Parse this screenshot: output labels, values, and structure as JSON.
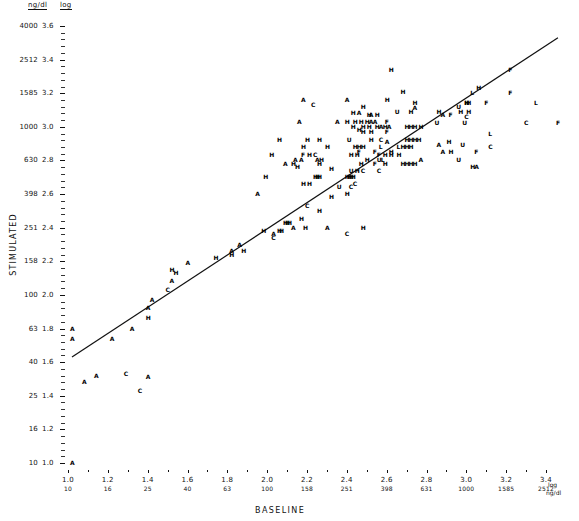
{
  "chart_data": {
    "type": "scatter",
    "title": "",
    "xlabel": "BASELINE",
    "ylabel": "STIMULATED",
    "axis_headers": {
      "units": "ng/dl",
      "scale": "log"
    },
    "x_unit_label": "log",
    "x_unit_label2": "ng/dl",
    "xlim_log": [
      1.0,
      3.5
    ],
    "ylim_log": [
      0.98,
      3.62
    ],
    "grid": false,
    "legend": null,
    "y_ticks_log": [
      "3.6",
      "3.4",
      "3.2",
      "3.0",
      "2.8",
      "2.6",
      "2.4",
      "2.2",
      "2.0",
      "1.8",
      "1.6",
      "1.4",
      "1.2",
      "1.0"
    ],
    "y_ticks_ngdl": [
      "4000",
      "2512",
      "1585",
      "1000",
      "630",
      "398",
      "251",
      "158",
      "100",
      "63",
      "40",
      "25",
      "16",
      "10"
    ],
    "x_ticks_log": [
      "1.0",
      "1.2",
      "1.4",
      "1.6",
      "1.8",
      "2.0",
      "2.2",
      "2.4",
      "2.6",
      "2.8",
      "3.0",
      "3.2",
      "3.4"
    ],
    "x_ticks_ngdl": [
      "10",
      "16",
      "25",
      "40",
      "63",
      "100",
      "158",
      "251",
      "398",
      "631",
      "1000",
      "1585",
      "2512"
    ],
    "regression_line": {
      "x0": 1.02,
      "y0": 1.63,
      "x1": 3.46,
      "y1": 3.53
    },
    "marker_groups": [
      "H",
      "A",
      "C",
      "U",
      "F",
      "L"
    ],
    "points": [
      [
        "H",
        2.62,
        3.34
      ],
      [
        "F",
        3.22,
        3.34
      ],
      [
        "H",
        3.06,
        3.23
      ],
      [
        "H",
        2.68,
        3.21
      ],
      [
        "L",
        3.03,
        3.2
      ],
      [
        "F",
        3.22,
        3.2
      ],
      [
        "H",
        2.6,
        3.16
      ],
      [
        "A",
        2.18,
        3.16
      ],
      [
        "A",
        2.4,
        3.16
      ],
      [
        "H",
        2.74,
        3.14
      ],
      [
        "H",
        3.0,
        3.14
      ],
      [
        "H",
        3.0,
        3.14
      ],
      [
        "H",
        3.01,
        3.14
      ],
      [
        "F",
        3.1,
        3.14
      ],
      [
        "L",
        3.35,
        3.14
      ],
      [
        "C",
        2.23,
        3.13
      ],
      [
        "H",
        2.48,
        3.12
      ],
      [
        "U",
        2.96,
        3.12
      ],
      [
        "A",
        2.74,
        3.11
      ],
      [
        "H",
        2.72,
        3.09
      ],
      [
        "U",
        2.65,
        3.09
      ],
      [
        "H",
        2.86,
        3.09
      ],
      [
        "H",
        2.97,
        3.09
      ],
      [
        "H",
        3.01,
        3.09
      ],
      [
        "A",
        2.46,
        3.08
      ],
      [
        "H",
        2.43,
        3.08
      ],
      [
        "A",
        2.52,
        3.07
      ],
      [
        "H",
        2.51,
        3.07
      ],
      [
        "H",
        2.55,
        3.07
      ],
      [
        "A",
        2.88,
        3.07
      ],
      [
        "F",
        2.92,
        3.07
      ],
      [
        "C",
        3.0,
        3.06
      ],
      [
        "A",
        2.16,
        3.03
      ],
      [
        "A",
        2.35,
        3.03
      ],
      [
        "H",
        2.4,
        3.03
      ],
      [
        "H",
        2.44,
        3.03
      ],
      [
        "H",
        2.47,
        3.03
      ],
      [
        "H",
        2.5,
        3.03
      ],
      [
        "A",
        2.52,
        3.03
      ],
      [
        "A",
        2.54,
        3.03
      ],
      [
        "F",
        2.6,
        3.03
      ],
      [
        "U",
        2.85,
        3.02
      ],
      [
        "U",
        2.99,
        3.02
      ],
      [
        "C",
        3.3,
        3.02
      ],
      [
        "F",
        3.46,
        3.02
      ],
      [
        "H",
        2.43,
        3.0
      ],
      [
        "H",
        2.48,
        3.0
      ],
      [
        "H",
        2.51,
        3.0
      ],
      [
        "H",
        2.55,
        3.0
      ],
      [
        "A",
        2.57,
        3.0
      ],
      [
        "H",
        2.59,
        3.0
      ],
      [
        "A",
        2.61,
        3.0
      ],
      [
        "H",
        2.7,
        3.0
      ],
      [
        "H",
        2.72,
        3.0
      ],
      [
        "H",
        2.74,
        3.0
      ],
      [
        "H",
        2.77,
        3.0
      ],
      [
        "H",
        2.46,
        2.98
      ],
      [
        "F",
        2.6,
        2.97
      ],
      [
        "H",
        2.48,
        2.97
      ],
      [
        "H",
        2.52,
        2.97
      ],
      [
        "L",
        3.12,
        2.96
      ],
      [
        "H",
        2.06,
        2.92
      ],
      [
        "H",
        2.2,
        2.92
      ],
      [
        "H",
        2.26,
        2.92
      ],
      [
        "U",
        2.41,
        2.92
      ],
      [
        "H",
        2.52,
        2.92
      ],
      [
        "C",
        2.57,
        2.92
      ],
      [
        "A",
        2.6,
        2.91
      ],
      [
        "H",
        2.7,
        2.92
      ],
      [
        "H",
        2.72,
        2.92
      ],
      [
        "H",
        2.74,
        2.92
      ],
      [
        "H",
        2.76,
        2.92
      ],
      [
        "H",
        2.91,
        2.91
      ],
      [
        "A",
        2.86,
        2.89
      ],
      [
        "U",
        2.98,
        2.89
      ],
      [
        "C",
        3.12,
        2.88
      ],
      [
        "H",
        2.18,
        2.88
      ],
      [
        "H",
        2.3,
        2.88
      ],
      [
        "H",
        2.44,
        2.88
      ],
      [
        "H",
        2.46,
        2.88
      ],
      [
        "H",
        2.48,
        2.88
      ],
      [
        "L",
        2.57,
        2.88
      ],
      [
        "L",
        2.66,
        2.88
      ],
      [
        "H",
        2.68,
        2.88
      ],
      [
        "H",
        2.7,
        2.88
      ],
      [
        "H",
        2.72,
        2.88
      ],
      [
        "F",
        2.46,
        2.85
      ],
      [
        "F",
        2.54,
        2.85
      ],
      [
        "H",
        2.62,
        2.85
      ],
      [
        "A",
        2.88,
        2.85
      ],
      [
        "H",
        2.92,
        2.85
      ],
      [
        "F",
        3.05,
        2.85
      ],
      [
        "H",
        2.02,
        2.83
      ],
      [
        "F",
        2.18,
        2.83
      ],
      [
        "H",
        2.21,
        2.83
      ],
      [
        "C",
        2.24,
        2.83
      ],
      [
        "H",
        2.42,
        2.83
      ],
      [
        "H",
        2.45,
        2.83
      ],
      [
        "F",
        2.56,
        2.83
      ],
      [
        "H",
        2.59,
        2.83
      ],
      [
        "H",
        2.62,
        2.83
      ],
      [
        "H",
        2.66,
        2.83
      ],
      [
        "A",
        2.14,
        2.8
      ],
      [
        "A",
        2.17,
        2.8
      ],
      [
        "A",
        2.25,
        2.8
      ],
      [
        "H",
        2.27,
        2.8
      ],
      [
        "L",
        2.58,
        2.8
      ],
      [
        "H",
        2.5,
        2.8
      ],
      [
        "U",
        2.56,
        2.8
      ],
      [
        "A",
        2.77,
        2.8
      ],
      [
        "U",
        2.96,
        2.8
      ],
      [
        "A",
        2.09,
        2.78
      ],
      [
        "H",
        2.13,
        2.78
      ],
      [
        "H",
        2.26,
        2.78
      ],
      [
        "H",
        2.47,
        2.78
      ],
      [
        "F",
        2.54,
        2.78
      ],
      [
        "H",
        2.59,
        2.78
      ],
      [
        "H",
        2.68,
        2.78
      ],
      [
        "H",
        2.7,
        2.78
      ],
      [
        "H",
        2.72,
        2.78
      ],
      [
        "H",
        2.74,
        2.78
      ],
      [
        "H",
        2.15,
        2.76
      ],
      [
        "H",
        2.32,
        2.75
      ],
      [
        "U",
        2.42,
        2.74
      ],
      [
        "H",
        2.45,
        2.74
      ],
      [
        "C",
        2.48,
        2.74
      ],
      [
        "C",
        2.56,
        2.74
      ],
      [
        "H",
        3.03,
        2.76
      ],
      [
        "A",
        3.05,
        2.76
      ],
      [
        "H",
        1.99,
        2.7
      ],
      [
        "H",
        2.24,
        2.7
      ],
      [
        "H",
        2.25,
        2.7
      ],
      [
        "H",
        2.26,
        2.7
      ],
      [
        "H",
        2.4,
        2.7
      ],
      [
        "H",
        2.41,
        2.7
      ],
      [
        "H",
        2.42,
        2.7
      ],
      [
        "H",
        2.43,
        2.7
      ],
      [
        "H",
        2.18,
        2.66
      ],
      [
        "H",
        2.21,
        2.66
      ],
      [
        "C",
        2.44,
        2.66
      ],
      [
        "U",
        2.36,
        2.64
      ],
      [
        "C",
        2.42,
        2.64
      ],
      [
        "A",
        1.95,
        2.6
      ],
      [
        "H",
        2.4,
        2.6
      ],
      [
        "H",
        2.32,
        2.58
      ],
      [
        "C",
        2.2,
        2.53
      ],
      [
        "H",
        2.26,
        2.5
      ],
      [
        "H",
        2.17,
        2.45
      ],
      [
        "H",
        2.09,
        2.43
      ],
      [
        "H",
        2.1,
        2.43
      ],
      [
        "H",
        2.11,
        2.43
      ],
      [
        "A",
        2.13,
        2.4
      ],
      [
        "H",
        2.19,
        2.4
      ],
      [
        "A",
        2.3,
        2.4
      ],
      [
        "H",
        1.98,
        2.38
      ],
      [
        "H",
        2.06,
        2.38
      ],
      [
        "H",
        2.07,
        2.38
      ],
      [
        "A",
        2.03,
        2.36
      ],
      [
        "C",
        2.03,
        2.34
      ],
      [
        "H",
        2.48,
        2.4
      ],
      [
        "C",
        2.4,
        2.36
      ],
      [
        "A",
        1.86,
        2.3
      ],
      [
        "A",
        1.82,
        2.26
      ],
      [
        "H",
        1.82,
        2.24
      ],
      [
        "H",
        1.88,
        2.26
      ],
      [
        "H",
        1.74,
        2.22
      ],
      [
        "A",
        1.6,
        2.19
      ],
      [
        "H",
        1.52,
        2.15
      ],
      [
        "H",
        1.54,
        2.13
      ],
      [
        "A",
        1.52,
        2.08
      ],
      [
        "C",
        1.5,
        2.03
      ],
      [
        "A",
        1.42,
        1.97
      ],
      [
        "A",
        1.4,
        1.92
      ],
      [
        "H",
        1.4,
        1.86
      ],
      [
        "A",
        1.32,
        1.8
      ],
      [
        "A",
        1.22,
        1.74
      ],
      [
        "C",
        1.29,
        1.53
      ],
      [
        "A",
        1.14,
        1.52
      ],
      [
        "A",
        1.08,
        1.48
      ],
      [
        "A",
        1.4,
        1.51
      ],
      [
        "C",
        1.36,
        1.43
      ],
      [
        "A",
        1.02,
        1.8
      ],
      [
        "A",
        1.02,
        1.74
      ],
      [
        "A",
        1.02,
        1.0
      ]
    ]
  }
}
